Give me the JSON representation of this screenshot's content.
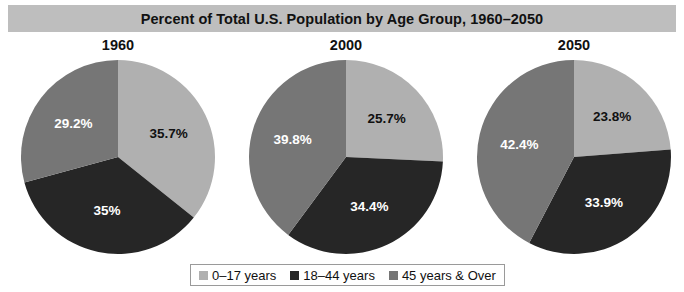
{
  "chart_data": {
    "type": "pie",
    "title": "Percent of Total U.S. Population by Age Group, 1960–2050",
    "xlabel": "",
    "ylabel": "",
    "legend_position": "bottom",
    "grid": false,
    "categories": [
      "0–17 years",
      "18–44 years",
      "45 years & Over"
    ],
    "colors": [
      "#b0b0b0",
      "#262626",
      "#767676"
    ],
    "panels": [
      {
        "label": "1960",
        "values": [
          35.7,
          35.0,
          29.2
        ],
        "value_labels": [
          "35.7%",
          "35%",
          "29.2%"
        ]
      },
      {
        "label": "2000",
        "values": [
          25.7,
          34.4,
          39.8
        ],
        "value_labels": [
          "25.7%",
          "34.4%",
          "39.8%"
        ]
      },
      {
        "label": "2050",
        "values": [
          23.8,
          33.9,
          42.4
        ],
        "value_labels": [
          "23.8%",
          "33.9%",
          "42.4%"
        ]
      }
    ]
  },
  "legend": {
    "items": [
      {
        "label": "0–17 years",
        "color": "#b0b0b0"
      },
      {
        "label": "18–44 years",
        "color": "#262626"
      },
      {
        "label": "45 years & Over",
        "color": "#767676"
      }
    ]
  },
  "style": {
    "title_background": "#bebebe",
    "title_color": "#111111",
    "page_background": "#ffffff",
    "legend_border": "#9a9a9a"
  }
}
